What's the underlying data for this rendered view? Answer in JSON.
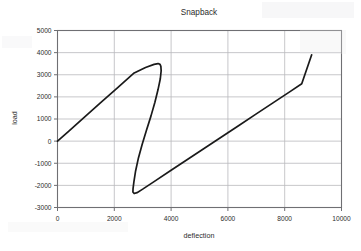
{
  "chart_data": {
    "type": "line",
    "title": "Snapback",
    "xlabel": "deflection",
    "ylabel": "load",
    "xlim": [
      0,
      10000
    ],
    "ylim": [
      -3000,
      5000
    ],
    "xticks": [
      "0",
      "2000",
      "4000",
      "6000",
      "8000",
      "10000"
    ],
    "xtick_values": [
      0,
      2000,
      4000,
      6000,
      8000,
      10000
    ],
    "yticks": [
      "5000",
      "4000",
      "3000",
      "2000",
      "1000",
      "0",
      "-1000",
      "-2000",
      "-3000"
    ],
    "ytick_values": [
      5000,
      4000,
      3000,
      2000,
      1000,
      0,
      -1000,
      -2000,
      -3000
    ],
    "grid": true,
    "legend": false,
    "line_color": "#1a1a1a",
    "grid_color": "#b9b9bd",
    "frame_color": "#6f6f73",
    "series": [
      {
        "name": "snapback",
        "points": [
          [
            0,
            0
          ],
          [
            400,
            455
          ],
          [
            900,
            1030
          ],
          [
            1500,
            1720
          ],
          [
            2100,
            2400
          ],
          [
            2700,
            3080
          ],
          [
            3100,
            3330
          ],
          [
            3400,
            3470
          ],
          [
            3540,
            3505
          ],
          [
            3610,
            3470
          ],
          [
            3640,
            3380
          ],
          [
            3650,
            3180
          ],
          [
            3620,
            2820
          ],
          [
            3540,
            2330
          ],
          [
            3430,
            1760
          ],
          [
            3290,
            1130
          ],
          [
            3130,
            480
          ],
          [
            2980,
            -150
          ],
          [
            2850,
            -760
          ],
          [
            2750,
            -1350
          ],
          [
            2690,
            -1840
          ],
          [
            2660,
            -2150
          ],
          [
            2655,
            -2300
          ],
          [
            2700,
            -2370
          ],
          [
            2800,
            -2330
          ],
          [
            3000,
            -2170
          ],
          [
            3400,
            -1830
          ],
          [
            4000,
            -1320
          ],
          [
            4600,
            -810
          ],
          [
            5200,
            -300
          ],
          [
            5800,
            210
          ],
          [
            6400,
            720
          ],
          [
            7000,
            1230
          ],
          [
            7600,
            1740
          ],
          [
            8200,
            2250
          ],
          [
            8600,
            2590
          ],
          [
            8950,
            3900
          ]
        ]
      }
    ]
  }
}
